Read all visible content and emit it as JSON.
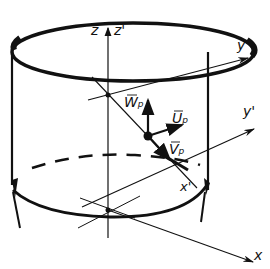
{
  "diagram": {
    "axes": {
      "x": "x",
      "y": "y",
      "z": "z",
      "x_prime": "x'",
      "y_prime": "y'",
      "z_prime": "z'"
    },
    "vectors": {
      "W": {
        "symbol": "W",
        "sub": "p"
      },
      "U": {
        "symbol": "U",
        "sub": "p"
      },
      "V": {
        "symbol": "V",
        "sub": "p"
      }
    }
  }
}
